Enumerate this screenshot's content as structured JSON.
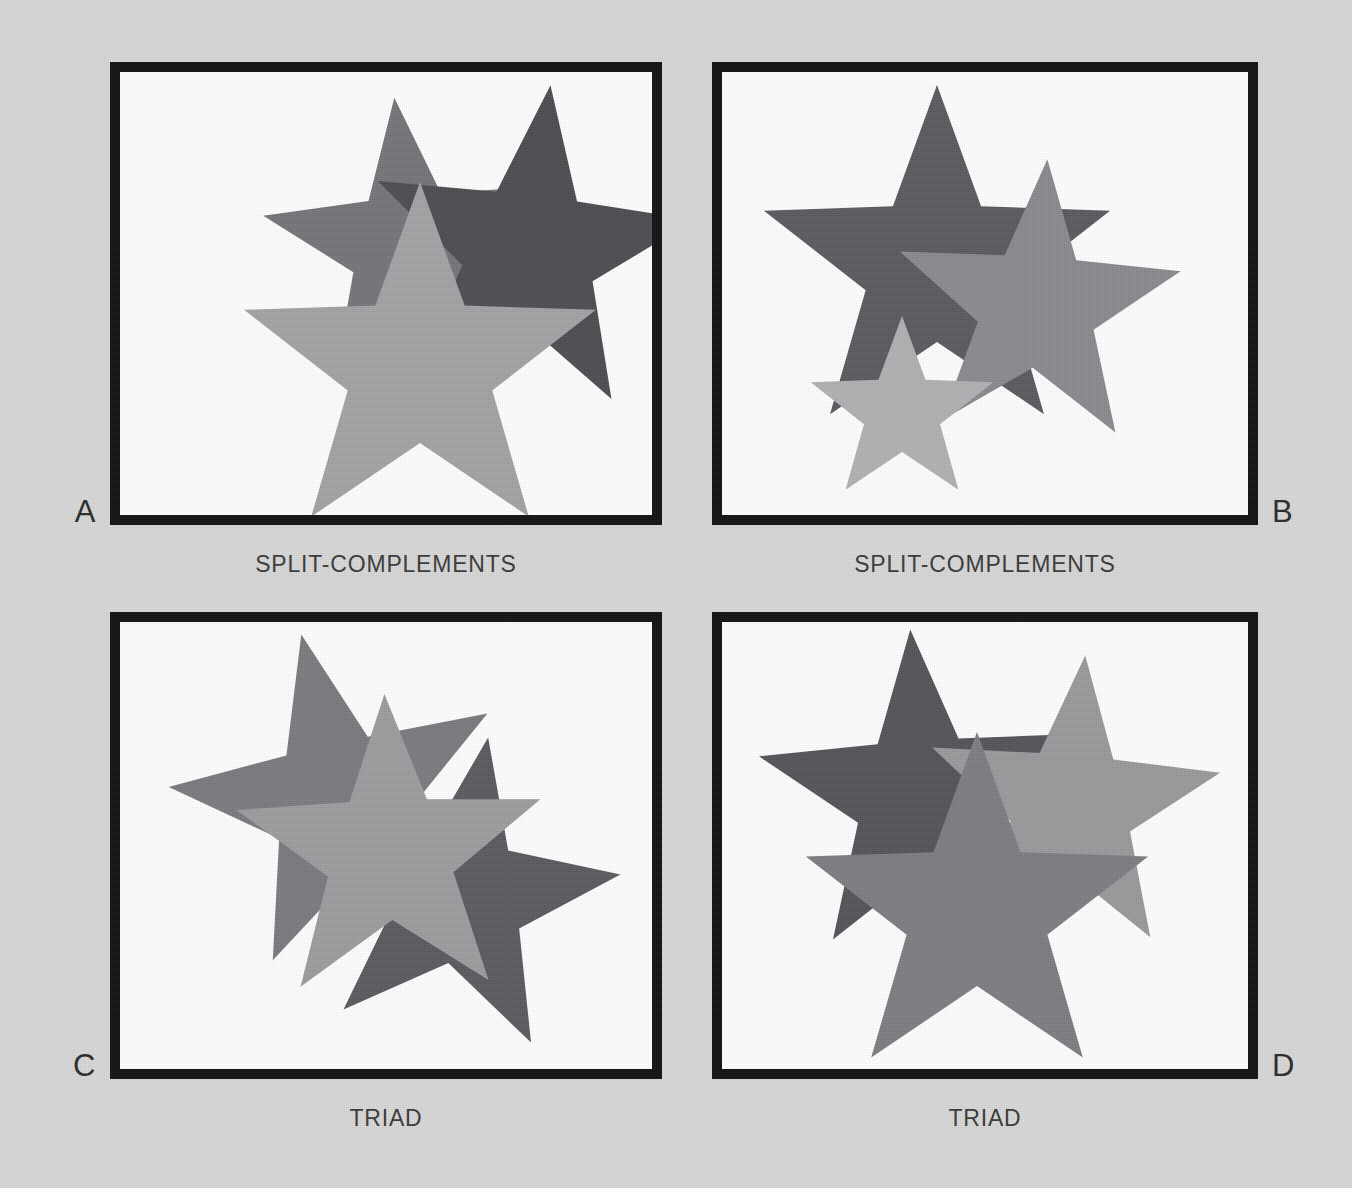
{
  "page": {
    "background_color": "#d8d8d8",
    "frame_border_color": "#121212",
    "frame_fill_color": "#ffffff",
    "caption_color": "#3a3a3a",
    "letter_color": "#2b2b2b"
  },
  "palette": {
    "dark_gray": "#4d4d52",
    "medium_gray": "#77777c",
    "mid_gray": "#82828a",
    "light_gray": "#a3a3a6",
    "pale_gray": "#b2b2b4",
    "soft_gray": "#999a9c"
  },
  "plates": [
    {
      "letter": "A",
      "letter_side": "left",
      "caption": "SPLIT-COMPLEMENTS",
      "stars": [
        {
          "name": "star-medium-upper-left",
          "fill": "#75757a",
          "cx": 290,
          "cy": 175,
          "outer": 150,
          "inner": 62,
          "rotation": -6
        },
        {
          "name": "star-dark-upper-right",
          "fill": "#4d4d52",
          "cx": 410,
          "cy": 180,
          "outer": 168,
          "inner": 69,
          "rotation": 7
        },
        {
          "name": "star-light-front",
          "fill": "#a3a3a6",
          "cx": 300,
          "cy": 295,
          "outer": 185,
          "inner": 76,
          "rotation": 0
        }
      ]
    },
    {
      "letter": "B",
      "letter_side": "right",
      "caption": "SPLIT-COMPLEMENTS",
      "stars": [
        {
          "name": "star-dark-large-left",
          "fill": "#5a5a60",
          "cx": 215,
          "cy": 195,
          "outer": 182,
          "inner": 75,
          "rotation": 0
        },
        {
          "name": "star-medium-right",
          "fill": "#8a8a90",
          "cx": 315,
          "cy": 235,
          "outer": 148,
          "inner": 61,
          "rotation": 4
        },
        {
          "name": "star-light-small-front",
          "fill": "#b2b2b4",
          "cx": 180,
          "cy": 340,
          "outer": 96,
          "inner": 40,
          "rotation": 0
        }
      ]
    },
    {
      "letter": "C",
      "letter_side": "left",
      "caption": "TRIAD",
      "stars": [
        {
          "name": "star-medium-upper-left",
          "fill": "#7b7b80",
          "cx": 220,
          "cy": 180,
          "outer": 172,
          "inner": 71,
          "rotation": -13
        },
        {
          "name": "star-dark-lower-right",
          "fill": "#5a5a60",
          "cx": 340,
          "cy": 275,
          "outer": 162,
          "inner": 67,
          "rotation": 10
        },
        {
          "name": "star-light-front",
          "fill": "#9d9da0",
          "cx": 270,
          "cy": 232,
          "outer": 160,
          "inner": 66,
          "rotation": -2
        }
      ]
    },
    {
      "letter": "D",
      "letter_side": "right",
      "caption": "TRIAD",
      "stars": [
        {
          "name": "star-dark-upper-left",
          "fill": "#54545a",
          "cx": 200,
          "cy": 175,
          "outer": 168,
          "inner": 69,
          "rotation": -4
        },
        {
          "name": "star-light-upper-right",
          "fill": "#9a9a9d",
          "cx": 350,
          "cy": 185,
          "outer": 152,
          "inner": 63,
          "rotation": 5
        },
        {
          "name": "star-medium-front",
          "fill": "#7d7d83",
          "cx": 255,
          "cy": 290,
          "outer": 180,
          "inner": 74,
          "rotation": 0
        }
      ]
    }
  ]
}
